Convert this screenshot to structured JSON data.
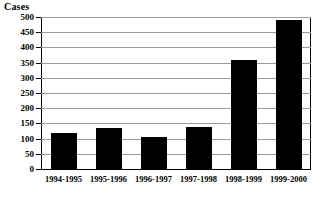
{
  "chart_data": {
    "type": "bar",
    "title": "",
    "ylabel": "Cases",
    "xlabel": "",
    "categories": [
      "1994-1995",
      "1995-1996",
      "1996-1997",
      "1997-1998",
      "1998-1999",
      "1999-2000"
    ],
    "values": [
      118,
      135,
      105,
      137,
      358,
      490
    ],
    "ylim": [
      0,
      500
    ],
    "ytick_step": 50,
    "yticks": [
      0,
      50,
      100,
      150,
      200,
      250,
      300,
      350,
      400,
      450,
      500
    ],
    "ytick_labels": [
      "0",
      "50",
      "100",
      "150",
      "200",
      "250",
      "300",
      "350",
      "400",
      "450",
      "500"
    ],
    "grid": true,
    "grid_axis": "y",
    "legend": false,
    "bar_color": "#000000",
    "grid_color": "#9a9a9a",
    "axis_color": "#000000",
    "background_color": "#ffffff"
  }
}
